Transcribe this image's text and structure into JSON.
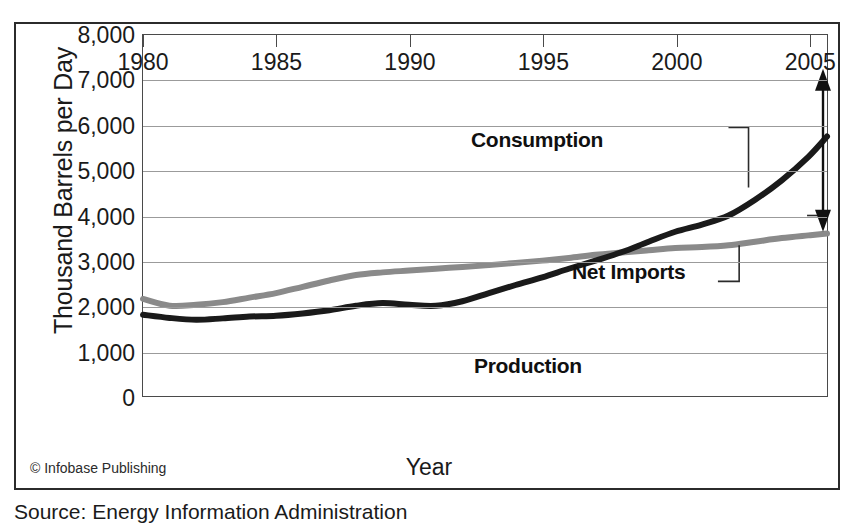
{
  "figure": {
    "credit": "© Infobase Publishing",
    "source": "Source: Energy Information Administration"
  },
  "chart_data": {
    "type": "line",
    "title": "",
    "xlabel": "Year",
    "ylabel": "Thousand Barrels per Day",
    "xlim": [
      1980,
      2005.7
    ],
    "ylim": [
      0,
      8000
    ],
    "grid": true,
    "legend_position": "inline-annotations",
    "x_ticks": [
      "1980",
      "1985",
      "1990",
      "1995",
      "2000",
      "2005"
    ],
    "x_tick_values": [
      1980,
      1985,
      1990,
      1995,
      2000,
      2005
    ],
    "y_ticks": [
      "0",
      "1,000",
      "2,000",
      "3,000",
      "4,000",
      "5,000",
      "6,000",
      "7,000",
      "8,000"
    ],
    "y_tick_values": [
      0,
      1000,
      2000,
      3000,
      4000,
      5000,
      6000,
      7000,
      8000
    ],
    "x": [
      1980,
      1981,
      1982,
      1983,
      1984,
      1985,
      1986,
      1987,
      1988,
      1989,
      1990,
      1991,
      1992,
      1993,
      1994,
      1995,
      1996,
      1997,
      1998,
      1999,
      2000,
      2001,
      2002,
      2003,
      2004,
      2005,
      2005.7
    ],
    "series": [
      {
        "name": "Consumption",
        "color": "#1a1a1a",
        "values": [
          1800,
          1730,
          1690,
          1720,
          1760,
          1780,
          1830,
          1900,
          2000,
          2060,
          2020,
          2000,
          2100,
          2280,
          2460,
          2630,
          2820,
          3000,
          3190,
          3420,
          3640,
          3800,
          4000,
          4350,
          4780,
          5300,
          5750
        ]
      },
      {
        "name": "Production",
        "color": "#8a8a8a",
        "values": [
          2150,
          2000,
          2020,
          2080,
          2180,
          2280,
          2420,
          2560,
          2680,
          2740,
          2780,
          2820,
          2860,
          2900,
          2950,
          3000,
          3060,
          3130,
          3180,
          3230,
          3280,
          3300,
          3340,
          3420,
          3500,
          3560,
          3600
        ]
      }
    ],
    "annotations": [
      {
        "label": "Consumption",
        "anchor_year": 2002.6,
        "anchor_value": 5600
      },
      {
        "label": "Net Imports",
        "anchor_year": 2005.55,
        "anchor_value": 4000
      },
      {
        "label": "Production",
        "anchor_year": 2002.1,
        "anchor_value": 3520
      }
    ],
    "net_imports_arrow": {
      "year": 2005.55,
      "top_value": 7250,
      "bottom_value": 3640,
      "description": "double-headed vertical arrow spanning the gap between Consumption and Production in 2005"
    }
  }
}
